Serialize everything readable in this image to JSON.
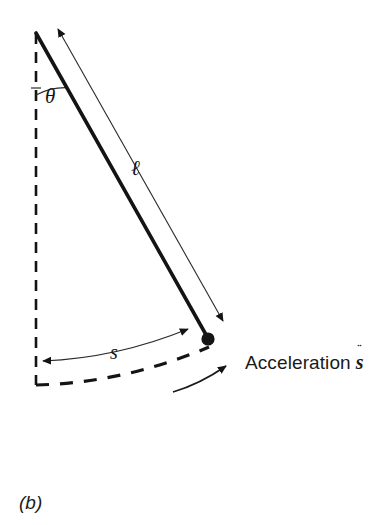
{
  "figure": {
    "caption": "(b)",
    "background_color": "#ffffff",
    "ink_color": "#1a1a1a",
    "width": 391,
    "height": 525
  },
  "labels": {
    "angle": "θ",
    "length": "ℓ",
    "arc_length": "s",
    "acceleration_text": "Acceleration",
    "acceleration_symbol": "s",
    "acceleration_accent": "¨"
  },
  "diagram": {
    "type": "free-body-pendulum-diagram",
    "pivot": {
      "x": 36,
      "y": 33
    },
    "bob": {
      "x": 208,
      "y": 339,
      "radius": 6.5,
      "fill": "#141414"
    },
    "rod": {
      "from": {
        "x": 36,
        "y": 33
      },
      "to": {
        "x": 208,
        "y": 339
      },
      "stroke_width": 3.6,
      "color": "#141414"
    },
    "vertical_reference": {
      "from": {
        "x": 36,
        "y": 33
      },
      "to": {
        "x": 36,
        "y": 385
      },
      "dash": "11 8",
      "stroke_width": 2.6,
      "color": "#141414"
    },
    "angle_arc": {
      "center": {
        "x": 36,
        "y": 33
      },
      "radius": 62,
      "from_deg": 90,
      "to_deg": 60.7,
      "stroke_width": 1.2
    },
    "length_dimension": {
      "from": {
        "x": 57,
        "y": 27
      },
      "to": {
        "x": 225,
        "y": 323
      },
      "stroke_width": 1.1,
      "double_headed": true
    },
    "arc_dimension": {
      "from": {
        "x": 40,
        "y": 362
      },
      "to": {
        "x": 191,
        "y": 327
      },
      "sagitta": 13,
      "stroke_width": 1.1,
      "double_headed": true
    },
    "swing_path": {
      "from": {
        "x": 36,
        "y": 385
      },
      "to": {
        "x": 209,
        "y": 347
      },
      "sagitta": 12,
      "dash": "13 11",
      "stroke_width": 3.2
    },
    "acceleration_arrow": {
      "from": {
        "x": 175,
        "y": 391
      },
      "to": {
        "x": 229,
        "y": 364
      },
      "sagitta": 6,
      "stroke_width": 1.8,
      "direction": "up-right"
    }
  }
}
